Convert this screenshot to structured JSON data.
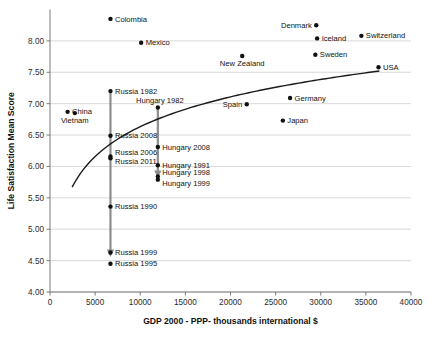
{
  "chart_data": {
    "type": "scatter",
    "title": "",
    "xlabel": "GDP 2000 - PPP- thousands international $",
    "ylabel": "Life Satisfaction Mean Score",
    "xlim": [
      0,
      40000
    ],
    "ylim": [
      4.0,
      8.5
    ],
    "xticks": [
      0,
      5000,
      10000,
      15000,
      20000,
      25000,
      30000,
      35000,
      40000
    ],
    "xtick_labels": [
      "0",
      "5000",
      "10000",
      "15000",
      "20000",
      "25000",
      "30000",
      "35000",
      "40000"
    ],
    "yticks": [
      4.0,
      4.5,
      5.0,
      5.5,
      6.0,
      6.5,
      7.0,
      7.5,
      8.0
    ],
    "ytick_labels": [
      "4.00",
      "4.50",
      "5.00",
      "5.50",
      "6.00",
      "6.50",
      "7.00",
      "7.50",
      "8.00"
    ],
    "grid": true,
    "legend": false,
    "points": [
      {
        "label": "Colombia",
        "x": 6700,
        "y": 8.35,
        "side": "right"
      },
      {
        "label": "Denmark",
        "x": 29500,
        "y": 8.25,
        "side": "left"
      },
      {
        "label": "Iceland",
        "x": 29600,
        "y": 8.04,
        "side": "right"
      },
      {
        "label": "Switzerland",
        "x": 34500,
        "y": 8.08,
        "side": "right"
      },
      {
        "label": "Mexico",
        "x": 10100,
        "y": 7.97,
        "side": "right"
      },
      {
        "label": "Sweden",
        "x": 29400,
        "y": 7.78,
        "side": "right"
      },
      {
        "label": "New Zealand",
        "x": 21300,
        "y": 7.76,
        "side": "below"
      },
      {
        "label": "USA",
        "x": 36400,
        "y": 7.58,
        "side": "right"
      },
      {
        "label": "Russia 1982",
        "x": 6700,
        "y": 7.2,
        "side": "right"
      },
      {
        "label": "Germany",
        "x": 26600,
        "y": 7.09,
        "side": "right"
      },
      {
        "label": "Spain",
        "x": 21800,
        "y": 6.99,
        "side": "left"
      },
      {
        "label": "Hungary 1982",
        "x": 11950,
        "y": 6.94,
        "side": "above-left"
      },
      {
        "label": "China",
        "x": 1950,
        "y": 6.87,
        "side": "right"
      },
      {
        "label": "Vietnam",
        "x": 2750,
        "y": 6.85,
        "side": "below"
      },
      {
        "label": "Japan",
        "x": 25800,
        "y": 6.73,
        "side": "right"
      },
      {
        "label": "Russia 2008",
        "x": 6700,
        "y": 6.49,
        "side": "right"
      },
      {
        "label": "Hungary 2008",
        "x": 11950,
        "y": 6.31,
        "side": "right"
      },
      {
        "label": "Russia 2006",
        "x": 6700,
        "y": 6.16,
        "side": "right-up"
      },
      {
        "label": "Russia 2011",
        "x": 6700,
        "y": 6.13,
        "side": "right-dn"
      },
      {
        "label": "Hungary 1991",
        "x": 11950,
        "y": 6.02,
        "side": "right"
      },
      {
        "label": "Hungary 1998",
        "x": 11950,
        "y": 5.84,
        "side": "right-up"
      },
      {
        "label": "Hungary 1999",
        "x": 11950,
        "y": 5.79,
        "side": "right-dn"
      },
      {
        "label": "Russia 1990",
        "x": 6700,
        "y": 5.36,
        "side": "right"
      },
      {
        "label": "Russia 1999",
        "x": 6700,
        "y": 4.63,
        "side": "right"
      },
      {
        "label": "Russia 1995",
        "x": 6700,
        "y": 4.45,
        "side": "right"
      }
    ],
    "trend_curve": {
      "description": "logarithmic fit line",
      "x_start": 2450,
      "x_end": 36500,
      "y_start": 5.67,
      "y_end": 7.52
    },
    "annotations": [
      {
        "name": "russia-decline-arrow",
        "x": 6700,
        "y_from": 7.2,
        "y_to": 4.58
      },
      {
        "name": "hungary-decline-arrow",
        "x": 11950,
        "y_from": 6.94,
        "y_to": 5.84
      }
    ],
    "colors": {
      "dot": "#111111",
      "trend": "#1a1a1a",
      "arrow": "#8d8d8d",
      "grid": "#c9c9c9",
      "axis": "#6e6e6e",
      "background": "#ffffff"
    }
  }
}
